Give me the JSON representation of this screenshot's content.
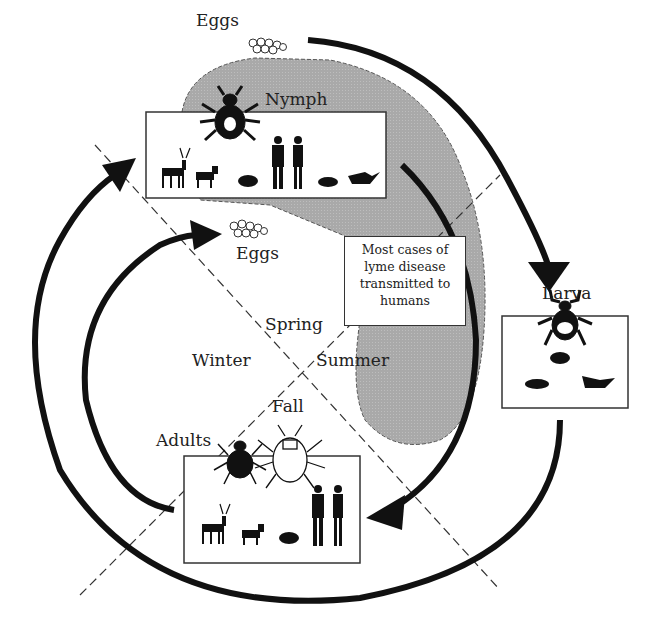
{
  "labels": {
    "eggs_top": "Eggs",
    "nymph": "Nymph",
    "eggs_mid": "Eggs",
    "larva": "Larva",
    "spring": "Spring",
    "winter": "Winter",
    "summer": "Summer",
    "fall": "Fall",
    "adults": "Adults"
  },
  "note": {
    "line1": "Most cases of",
    "line2": "lyme disease",
    "line3": "transmitted to",
    "line4": "humans"
  },
  "stages": [
    {
      "name": "Nymph",
      "hosts": [
        "deer",
        "fox",
        "rodent",
        "human-male",
        "human-female",
        "mouse",
        "bird"
      ]
    },
    {
      "name": "Larva",
      "hosts": [
        "mouse",
        "rodent",
        "bird"
      ]
    },
    {
      "name": "Adults",
      "hosts": [
        "deer",
        "fox",
        "rodent",
        "human-male",
        "human-female"
      ]
    }
  ],
  "colors": {
    "shade": "#a8a8a8",
    "ink": "#111111"
  }
}
